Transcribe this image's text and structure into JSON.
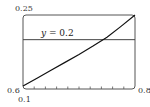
{
  "chart_data": {
    "type": "line",
    "title": "",
    "xlabel": "",
    "ylabel": "",
    "xlim": [
      0.6,
      0.8
    ],
    "ylim": [
      0.1,
      0.25
    ],
    "x_ticks_count": 11,
    "x_tick_step": 0.02,
    "grid": false,
    "legend": null,
    "corner_labels": {
      "x_min": "0.6",
      "x_max": "0.8",
      "y_min": "0.1",
      "y_max": "0.25"
    },
    "series": [
      {
        "name": "curve",
        "x": [
          0.6,
          0.625,
          0.65,
          0.675,
          0.7,
          0.725,
          0.75,
          0.775,
          0.8
        ],
        "y": [
          0.106,
          0.122,
          0.138,
          0.154,
          0.17,
          0.187,
          0.205,
          0.227,
          0.25
        ]
      },
      {
        "name": "y = 0.2",
        "x": [
          0.6,
          0.8
        ],
        "y": [
          0.2,
          0.2
        ]
      }
    ],
    "annotations": [
      {
        "text": "y = 0.2",
        "x": 0.625,
        "y": 0.205
      }
    ],
    "intersection": {
      "x": 0.737,
      "y": 0.2
    }
  },
  "labels": {
    "y_top": "0.25",
    "x_left": "0.6",
    "x_right": "0.8",
    "y_bottom": "0.1",
    "hline_label_var": "y",
    "hline_label_rest": " = 0.2"
  },
  "colors": {
    "frame": "#555555",
    "curve": "#111111",
    "hline": "#444444"
  }
}
